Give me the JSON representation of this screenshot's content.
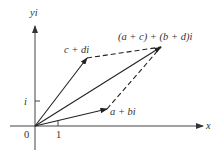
{
  "diagram": {
    "type": "complex-plane-vector-addition",
    "axes": {
      "x_label": "x",
      "y_label": "yi",
      "origin_label": "0",
      "x_tick_label": "1",
      "y_tick_label": "i"
    },
    "points": {
      "z1": {
        "label": "a + bi"
      },
      "z2": {
        "label": "c + di"
      },
      "sum": {
        "label": "(a + c) + (b + d)i"
      }
    },
    "colors": {
      "ink": "#333333",
      "background": "#ffffff"
    }
  }
}
